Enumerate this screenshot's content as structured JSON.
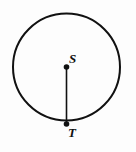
{
  "figure": {
    "name": "circle-with-radius",
    "background_color": "#fdfdfd",
    "stroke_color": "#111111",
    "canvas": {
      "width": 136,
      "height": 152
    },
    "circle": {
      "name": "circle-outline",
      "center_x": 66.5,
      "center_y": 67,
      "radius": 53.5,
      "stroke_width": 2,
      "fill": "none"
    },
    "segment": {
      "name": "radius-segment-ST",
      "x1": 66.5,
      "y1": 67,
      "x2": 66.5,
      "y2": 124,
      "stroke_width": 1.6
    },
    "points": [
      {
        "id": "S",
        "label": "S",
        "name": "point-S",
        "role": "center",
        "cx": 66.5,
        "cy": 67,
        "dot_radius": 2.8,
        "label_x": 69,
        "label_y": 52
      },
      {
        "id": "T",
        "label": "T",
        "name": "point-T",
        "role": "on-circumference",
        "cx": 66.5,
        "cy": 124,
        "dot_radius": 2.8,
        "label_x": 68,
        "label_y": 126
      }
    ]
  }
}
